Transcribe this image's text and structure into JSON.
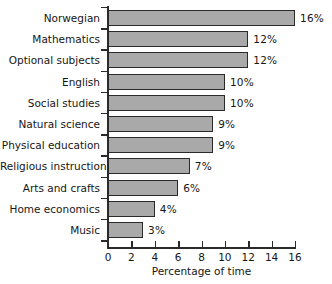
{
  "chart_data": {
    "type": "bar",
    "orientation": "horizontal",
    "title": "",
    "xlabel": "Percentage of time",
    "ylabel": "",
    "xlim": [
      0,
      16
    ],
    "xticks": [
      0,
      2,
      4,
      6,
      8,
      10,
      12,
      14,
      16
    ],
    "grid": false,
    "legend": null,
    "bar_color": "#a9a9a9",
    "bar_edge_color": "#2a2a2a",
    "categories": [
      "Norwegian",
      "Mathematics",
      "Optional subjects",
      "English",
      "Social studies",
      "Natural science",
      "Physical education",
      "Religious instruction",
      "Arts and crafts",
      "Home economics",
      "Music"
    ],
    "values": [
      16,
      12,
      12,
      10,
      10,
      9,
      9,
      7,
      6,
      4,
      3
    ],
    "value_labels": [
      "16%",
      "12%",
      "12%",
      "10%",
      "10%",
      "9%",
      "9%",
      "7%",
      "6%",
      "4%",
      "3%"
    ]
  }
}
